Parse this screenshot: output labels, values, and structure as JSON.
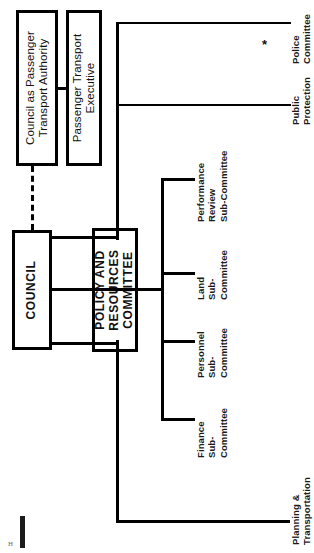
{
  "diagram": {
    "orientation": "rotated-90-counterclockwise",
    "footnote_marker": "*",
    "nodes": {
      "council_pta": "Council as Passenger\nTransport Authority",
      "council_pta_l1": "Council as Passenger",
      "council_pta_l2": "Transport Authority",
      "pte_l1": "Passenger Transport",
      "pte_l2": "Executive",
      "council": "COUNCIL",
      "policy_l1": "POLICY AND",
      "policy_l2": "RESOURCES",
      "policy_l3": "COMMITTEE"
    },
    "committees": [
      {
        "id": "police",
        "l1": "Police",
        "l2": "Committee",
        "l3": "",
        "marker": "*"
      },
      {
        "id": "public-protection",
        "l1": "Public",
        "l2": "Protection",
        "l3": "Committee",
        "marker": ""
      },
      {
        "id": "planning-transportation",
        "l1": "Planning &",
        "l2": "Transportation",
        "l3": "Committee",
        "marker": ""
      }
    ],
    "sub_committees": [
      {
        "id": "performance-review",
        "l1": "Performance",
        "l2": "Review",
        "l3": "Sub-Committee"
      },
      {
        "id": "land",
        "l1": "Land",
        "l2": "Sub-",
        "l3": "Committee"
      },
      {
        "id": "personnel",
        "l1": "Personnel",
        "l2": "Sub-",
        "l3": "Committee"
      },
      {
        "id": "finance",
        "l1": "Finance",
        "l2": "Sub-",
        "l3": "Committee"
      }
    ],
    "colors": {
      "ink": "#000000",
      "paper": "#ffffff",
      "label": "#1a1a1a"
    }
  }
}
